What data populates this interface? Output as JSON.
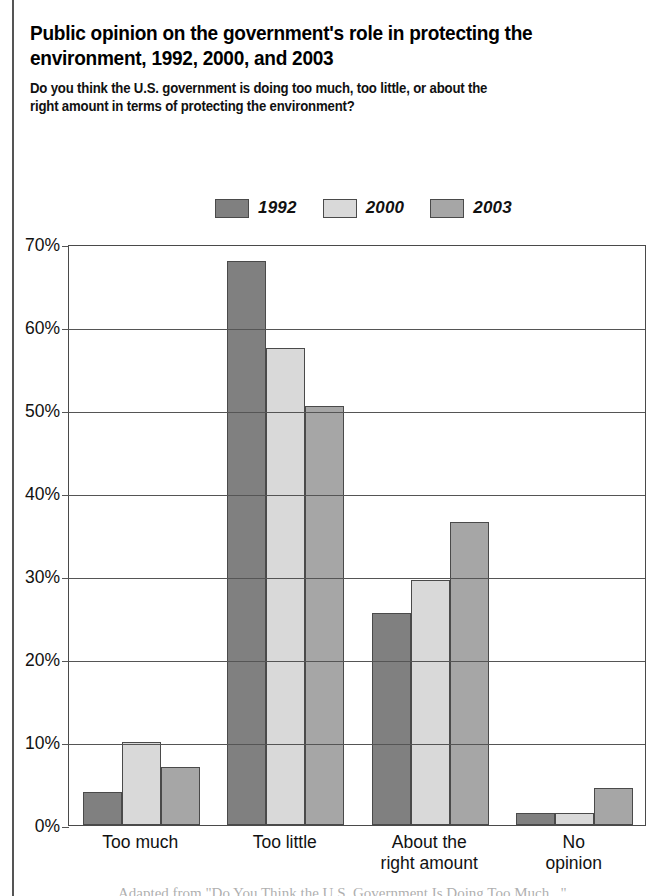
{
  "header": {
    "title": "Public opinion on the government's role in protecting the\nenvironment, 1992, 2000, and 2003",
    "subtitle": "Do you think the U.S. government is doing too much, too little, or about the\nright amount in terms of protecting the environment?"
  },
  "footer": {
    "caption": "Adapted from \"Do You Think the U.S. Government Is Doing Too Much...\""
  },
  "legend": {
    "position": "top-center",
    "items": [
      {
        "label": "1992",
        "color": "#808080"
      },
      {
        "label": "2000",
        "color": "#d9d9d9"
      },
      {
        "label": "2003",
        "color": "#a6a6a6"
      }
    ]
  },
  "axis": {
    "y_ticks": [
      "0%",
      "10%",
      "20%",
      "30%",
      "40%",
      "50%",
      "60%",
      "70%"
    ],
    "y_tick_values": [
      0,
      10,
      20,
      30,
      40,
      50,
      60,
      70
    ]
  },
  "chart_data": {
    "type": "bar",
    "title": "Public opinion on the government's role in protecting the environment, 1992, 2000, and 2003",
    "subtitle": "Do you think the U.S. government is doing too much, too little, or about the right amount in terms of protecting the environment?",
    "categories": [
      "Too much",
      "Too little",
      "About the\nright amount",
      "No opinion"
    ],
    "series": [
      {
        "name": "1992",
        "color": "#808080",
        "values": [
          4,
          68,
          25.5,
          1.5
        ]
      },
      {
        "name": "2000",
        "color": "#d9d9d9",
        "values": [
          10,
          57.5,
          29.5,
          1.5
        ]
      },
      {
        "name": "2003",
        "color": "#a6a6a6",
        "values": [
          7,
          50.5,
          36.5,
          4.5
        ]
      }
    ],
    "xlabel": "",
    "ylabel": "",
    "ylim": [
      0,
      70
    ],
    "ytick_step": 10,
    "grid": "horizontal",
    "legend_position": "top-center"
  }
}
